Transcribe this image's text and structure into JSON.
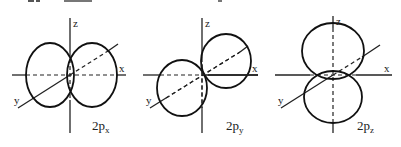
{
  "figure": {
    "type": "atomic-orbital-diagram",
    "background": "#ffffff",
    "stroke_color": "#111111",
    "panels": [
      {
        "id": "2px",
        "label_main": "2p",
        "label_sub": "x",
        "axes": {
          "z": "z",
          "x": "x",
          "y": "y"
        },
        "lobe_orientation": "along x-axis"
      },
      {
        "id": "2py",
        "label_main": "2p",
        "label_sub": "y",
        "axes": {
          "z": "z",
          "x": "x",
          "y": "y"
        },
        "lobe_orientation": "along y-axis"
      },
      {
        "id": "2pz",
        "label_main": "2p",
        "label_sub": "z",
        "axes": {
          "z": "z",
          "x": "x",
          "y": "y"
        },
        "lobe_orientation": "along z-axis"
      }
    ]
  }
}
